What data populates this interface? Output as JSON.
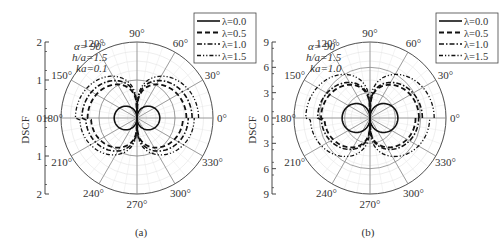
{
  "chart_data": [
    {
      "type": "polar-line",
      "panel": "(a)",
      "ylabel": "DSCF",
      "params": [
        "α= 90°",
        "h/a=1.5",
        "ka=0.1"
      ],
      "radial_ticks": [
        "2",
        "1",
        "0",
        "1",
        "2"
      ],
      "rmax": 2,
      "angle_ticks": [
        "0°",
        "30°",
        "60°",
        "90°",
        "120°",
        "150°",
        "180°",
        "210°",
        "240°",
        "270°",
        "300°",
        "330°"
      ],
      "legend": [
        "λ=0.0",
        "λ=0.5",
        "λ=1.0",
        "λ=1.5"
      ],
      "series": [
        {
          "name": "λ=0.0",
          "style": "solid",
          "peak_value": 0.6
        },
        {
          "name": "λ=0.5",
          "style": "dash",
          "peak_value": 1.3
        },
        {
          "name": "λ=1.0",
          "style": "dash-dot",
          "peak_value": 1.45
        },
        {
          "name": "λ=1.5",
          "style": "dash-dot-dot",
          "peak_value": 1.62
        }
      ]
    },
    {
      "type": "polar-line",
      "panel": "(b)",
      "ylabel": "DSCF",
      "params": [
        "α= 90°",
        "h/a=1.5",
        "ka=1.0"
      ],
      "radial_ticks": [
        "9",
        "6",
        "3",
        "0",
        "3",
        "6",
        "9"
      ],
      "rmax": 9,
      "angle_ticks": [
        "0°",
        "30°",
        "60°",
        "90°",
        "120°",
        "150°",
        "180°",
        "210°",
        "240°",
        "270°",
        "300°",
        "330°"
      ],
      "legend": [
        "λ=0.0",
        "λ=0.5",
        "λ=1.0",
        "λ=1.5"
      ],
      "series": [
        {
          "name": "λ=0.0",
          "style": "solid",
          "peak_value": 3.3
        },
        {
          "name": "λ=0.5",
          "style": "dash",
          "peak_value": 5.8
        },
        {
          "name": "λ=1.0",
          "style": "dash-dot",
          "peak_value": 6.2
        },
        {
          "name": "λ=1.5",
          "style": "dash-dot-dot",
          "peak_value": 7.6
        }
      ]
    }
  ],
  "captions": [
    "(a)",
    "(b)"
  ]
}
